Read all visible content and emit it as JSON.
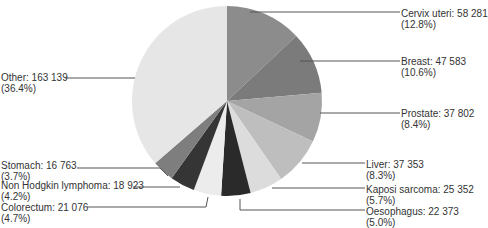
{
  "chart_data": {
    "type": "pie",
    "title": "",
    "center": [
      227,
      101
    ],
    "radius": 95,
    "start_angle_deg": 0,
    "direction": "clockwise",
    "legend": "none (leader-line labels)",
    "slices": [
      {
        "name": "Cervix uteri",
        "value": 58281,
        "value_text": "58 281",
        "pct": "12.8%",
        "color": "#8c8c8c",
        "side": "right",
        "label_x": 401,
        "label_y": 8,
        "line": [
          [
            250,
            12
          ],
          [
            400,
            12
          ]
        ]
      },
      {
        "name": "Breast",
        "value": 47583,
        "value_text": "47 583",
        "pct": "10.6%",
        "color": "#7b7b7b",
        "side": "right",
        "label_x": 401,
        "label_y": 56,
        "line": [
          [
            300,
            61
          ],
          [
            400,
            61
          ]
        ]
      },
      {
        "name": "Prostate",
        "value": 37802,
        "value_text": "37 802",
        "pct": "8.4%",
        "color": "#a4a4a4",
        "side": "right",
        "label_x": 401,
        "label_y": 108,
        "line": [
          [
            320,
            113
          ],
          [
            400,
            113
          ]
        ]
      },
      {
        "name": "Liver",
        "value": 37353,
        "value_text": "37 353",
        "pct": "8.3%",
        "color": "#bebebe",
        "side": "right",
        "label_x": 366,
        "label_y": 159,
        "line": [
          [
            302,
            163
          ],
          [
            365,
            163
          ]
        ]
      },
      {
        "name": "Kaposi sarcoma",
        "value": 25352,
        "value_text": "25 352",
        "pct": "5.7%",
        "color": "#dcdcdc",
        "side": "right",
        "label_x": 366,
        "label_y": 184,
        "line": [
          [
            272,
            188
          ],
          [
            365,
            188
          ]
        ]
      },
      {
        "name": "Oesophagus",
        "value": 22373,
        "value_text": "22 373",
        "pct": "5.0%",
        "color": "#2a2a2a",
        "side": "right",
        "label_x": 366,
        "label_y": 206,
        "line": [
          [
            240,
            199
          ],
          [
            240,
            210
          ],
          [
            365,
            210
          ]
        ]
      },
      {
        "name": "Colorectum",
        "value": 21076,
        "value_text": "21 076",
        "pct": "4.7%",
        "color": "#ececec",
        "side": "left",
        "label_x": 1,
        "label_y": 202,
        "line": [
          [
            208,
            197
          ],
          [
            206,
            207
          ],
          [
            87,
            207
          ]
        ]
      },
      {
        "name": "Non Hodgkin lymphoma",
        "value": 18923,
        "value_text": "18 923",
        "pct": "4.2%",
        "color": "#353535",
        "side": "left",
        "label_x": 1,
        "label_y": 180,
        "line": [
          [
            180,
            187
          ],
          [
            133,
            187
          ]
        ]
      },
      {
        "name": "Stomach",
        "value": 16763,
        "value_text": "16 763",
        "pct": "3.7%",
        "color": "#7e7e7e",
        "side": "left",
        "label_x": 1,
        "label_y": 160,
        "line": [
          [
            168,
            176
          ],
          [
            160,
            168
          ],
          [
            77,
            168
          ]
        ]
      },
      {
        "name": "Other",
        "value": 163139,
        "value_text": "163 139",
        "pct": "36.4%",
        "color": "#e6e6e6",
        "side": "left",
        "label_x": 1,
        "label_y": 72,
        "line": [
          [
            65,
            78
          ],
          [
            135,
            78
          ]
        ]
      }
    ],
    "total": 448645
  },
  "labels": [
    {
      "line1": "Cervix uteri: 58 281",
      "line2": "(12.8%)"
    },
    {
      "line1": "Breast: 47 583",
      "line2": "(10.6%)"
    },
    {
      "line1": "Prostate: 37 802",
      "line2": "(8.4%)"
    },
    {
      "line1": "Liver: 37 353",
      "line2": "(8.3%)"
    },
    {
      "line1": "Kaposi sarcoma: 25 352",
      "line2": "(5.7%)"
    },
    {
      "line1": "Oesophagus: 22 373",
      "line2": "(5.0%)"
    },
    {
      "line1": "Colorectum: 21 076",
      "line2": "(4.7%)"
    },
    {
      "line1": "Non Hodgkin lymphoma: 18 923",
      "line2": "(4.2%)"
    },
    {
      "line1": "Stomach: 16 763",
      "line2": "(3.7%)"
    },
    {
      "line1": "Other: 163 139",
      "line2": "(36.4%)"
    }
  ],
  "line_color": "#555555",
  "text_color": "#333333"
}
